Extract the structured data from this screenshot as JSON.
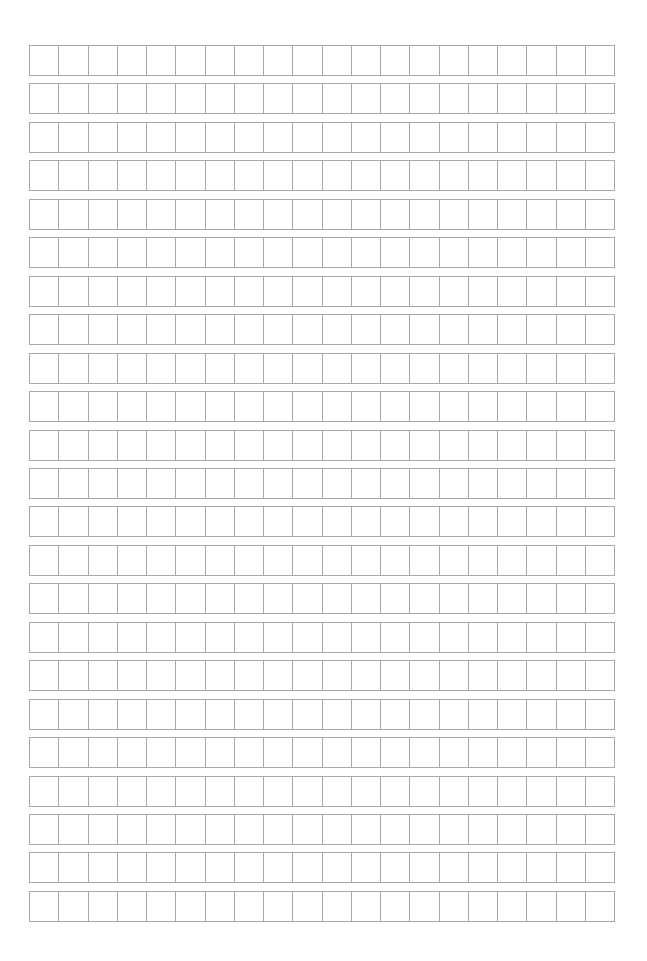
{
  "page": {
    "type": "manuscript-grid-paper",
    "rows": 23,
    "columns": 20,
    "line_color": "#a8a8a8",
    "background": "#ffffff",
    "grid_left": 29,
    "grid_top": 45,
    "grid_width": 586,
    "cell_height": 30,
    "row_pitch": 38.45
  }
}
